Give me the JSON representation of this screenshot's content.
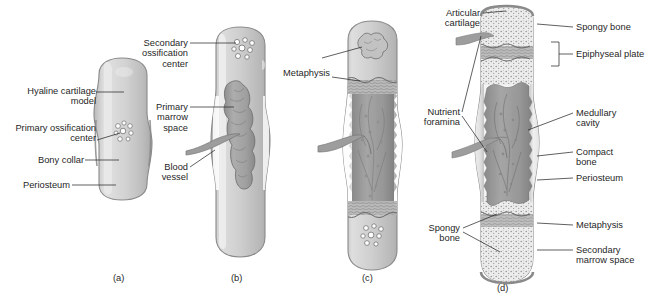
{
  "figure": {
    "panels": [
      {
        "id": "a",
        "letter": "(a)"
      },
      {
        "id": "b",
        "letter": "(b)"
      },
      {
        "id": "c",
        "letter": "(c)"
      },
      {
        "id": "d",
        "letter": "(d)"
      }
    ]
  },
  "labels": {
    "a": {
      "hyaline_cartilage_model": "Hyaline cartilage\nmodel",
      "primary_ossification_center": "Primary ossification\ncenter",
      "bony_collar": "Bony collar",
      "periosteum": "Periosteum"
    },
    "b": {
      "secondary_ossification_center": "Secondary\nossification\ncenter",
      "primary_marrow_space": "Primary\nmarrow\nspace",
      "blood_vessel": "Blood\nvessel"
    },
    "c": {
      "metaphysis": "Metaphysis"
    },
    "d": {
      "articular_cartilage": "Articular\ncartilage",
      "nutrient_foramina": "Nutrient\nforamina",
      "spongy_bone_left": "Spongy\nbone",
      "spongy_bone_right": "Spongy bone",
      "epiphyseal_plate": "Epiphyseal plate",
      "medullary_cavity": "Medullary\ncavity",
      "compact_bone": "Compact\nbone",
      "periosteum": "Periosteum",
      "metaphysis": "Metaphysis",
      "secondary_marrow_space": "Secondary\nmarrow space"
    }
  },
  "colors": {
    "ink": "#2b2b2b",
    "cartilage_light": "#dcdcdc",
    "cartilage_mid": "#c6c6c6",
    "bone_outline": "#7a7a7a",
    "marrow_dark": "#9a9a9a",
    "spongy": "#b4b4b4",
    "background": "#ffffff"
  }
}
